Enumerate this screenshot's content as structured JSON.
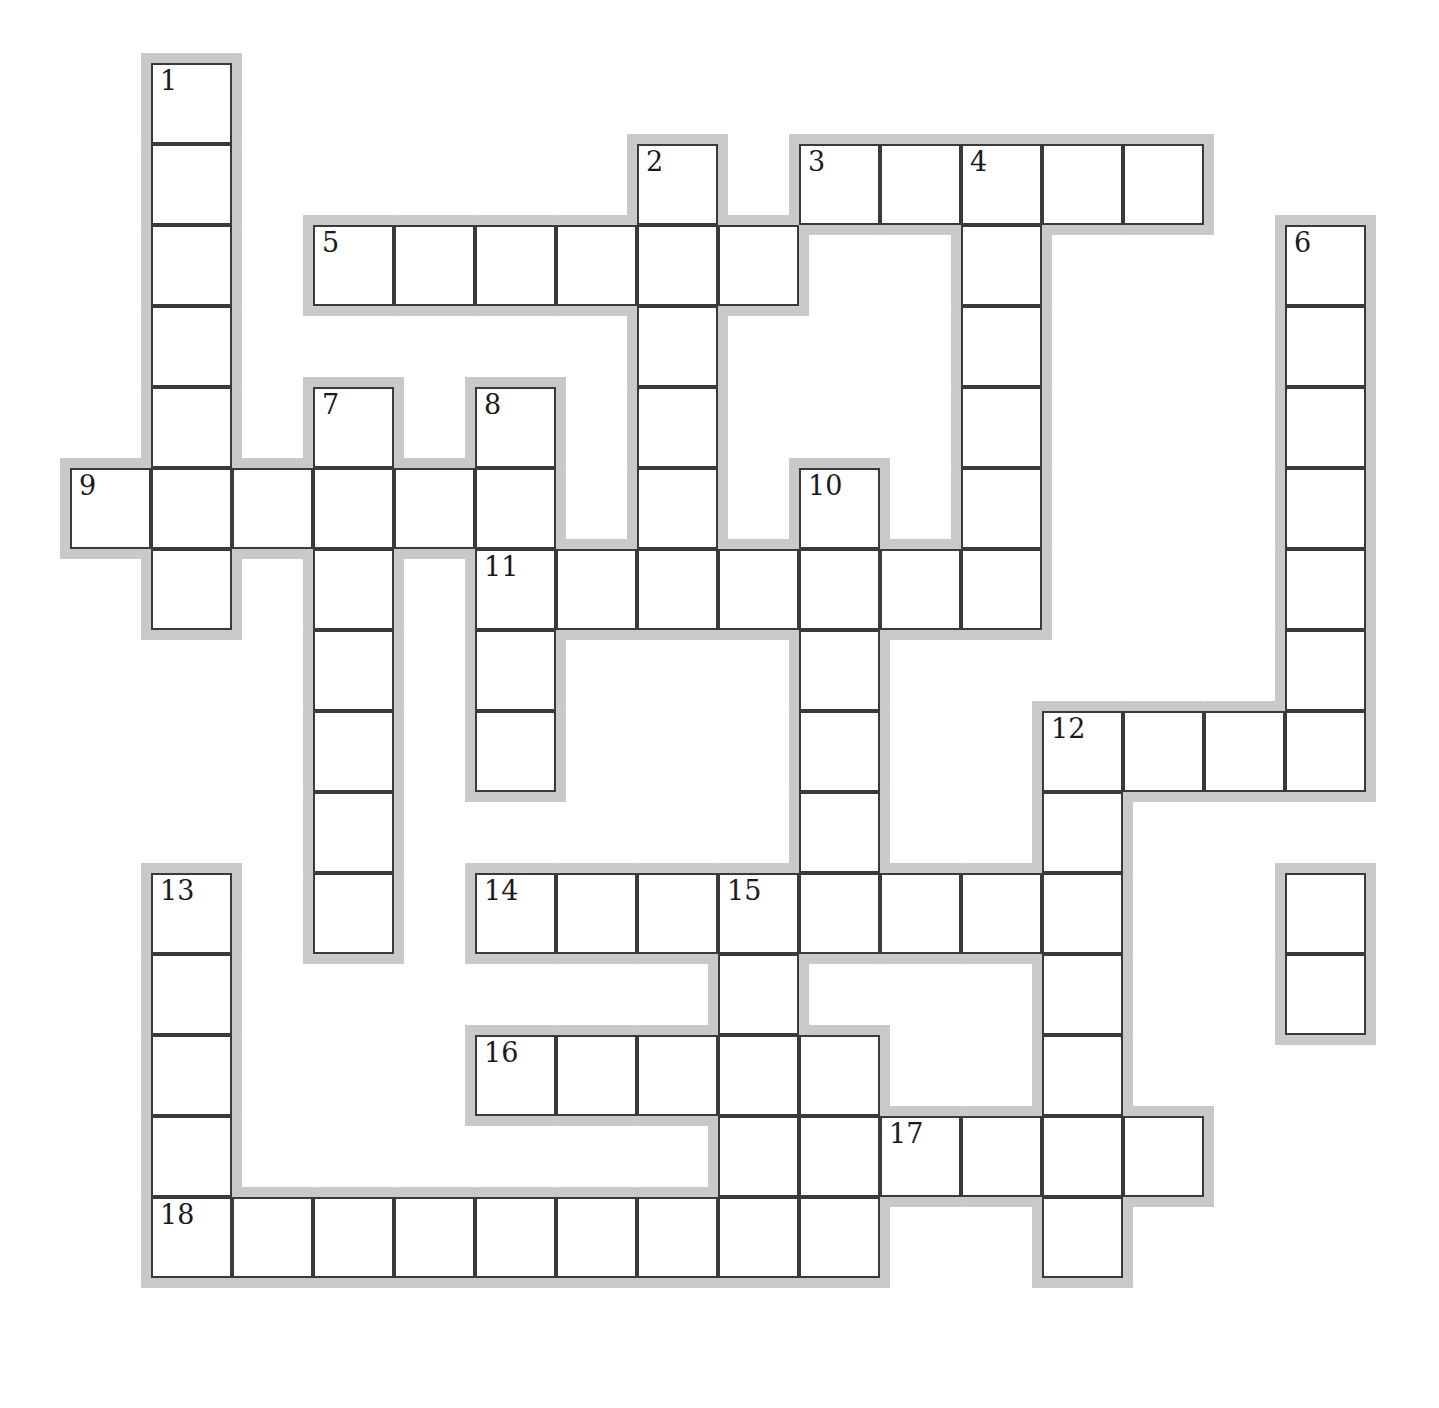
{
  "puzzle": {
    "kind": "crossword-grid",
    "title": "",
    "grid": {
      "cell_size": 81,
      "origin_x": 70,
      "origin_y": 63,
      "halo_width": 10,
      "columns": 16,
      "rows": 17,
      "cell_fill": "#ffffff",
      "cell_border_color": "#3a3a3a",
      "halo_color": "#c9c9c9",
      "number_color": "#1a1a1a",
      "background": "#ffffff"
    },
    "entries": [
      {
        "number": "1",
        "direction": "down",
        "col": 1,
        "row": 0,
        "length": 7
      },
      {
        "number": "2",
        "direction": "down",
        "col": 7,
        "row": 1,
        "length": 6
      },
      {
        "number": "3",
        "direction": "across",
        "col": 9,
        "row": 1,
        "length": 5
      },
      {
        "number": "4",
        "direction": "down",
        "col": 11,
        "row": 1,
        "length": 7
      },
      {
        "number": "5",
        "direction": "across",
        "col": 3,
        "row": 2,
        "length": 6
      },
      {
        "number": "6",
        "direction": "down",
        "col": 15,
        "row": 2,
        "length": 10
      },
      {
        "number": "7",
        "direction": "down",
        "col": 3,
        "row": 4,
        "length": 7
      },
      {
        "number": "8",
        "direction": "down",
        "col": 5,
        "row": 4,
        "length": 5
      },
      {
        "number": "9",
        "direction": "across",
        "col": 0,
        "row": 5,
        "length": 6
      },
      {
        "number": "10",
        "direction": "down",
        "col": 9,
        "row": 5,
        "length": 6
      },
      {
        "number": "11",
        "direction": "across",
        "col": 5,
        "row": 6,
        "length": 7
      },
      {
        "number": "12",
        "direction": "across",
        "col": 12,
        "row": 8,
        "length": 4
      },
      {
        "number": "13",
        "direction": "down",
        "col": 1,
        "row": 10,
        "length": 5
      },
      {
        "number": "14",
        "direction": "across",
        "col": 5,
        "row": 10,
        "length": 8
      },
      {
        "number": "15",
        "direction": "down",
        "col": 8,
        "row": 10,
        "length": 5
      },
      {
        "number": "16",
        "direction": "across",
        "col": 5,
        "row": 12,
        "length": 5
      },
      {
        "number": "17",
        "direction": "across",
        "col": 10,
        "row": 13,
        "length": 4
      },
      {
        "number": "18",
        "direction": "across",
        "col": 1,
        "row": 14,
        "length": 9
      }
    ],
    "cells": [
      {
        "col": 1,
        "row": 0,
        "number": "1",
        "letter": ""
      },
      {
        "col": 1,
        "row": 1,
        "number": "",
        "letter": ""
      },
      {
        "col": 1,
        "row": 2,
        "number": "",
        "letter": ""
      },
      {
        "col": 1,
        "row": 3,
        "number": "",
        "letter": ""
      },
      {
        "col": 1,
        "row": 4,
        "number": "",
        "letter": ""
      },
      {
        "col": 1,
        "row": 5,
        "number": "",
        "letter": ""
      },
      {
        "col": 1,
        "row": 6,
        "number": "",
        "letter": ""
      },
      {
        "col": 7,
        "row": 1,
        "number": "2",
        "letter": ""
      },
      {
        "col": 9,
        "row": 1,
        "number": "3",
        "letter": ""
      },
      {
        "col": 10,
        "row": 1,
        "number": "",
        "letter": ""
      },
      {
        "col": 11,
        "row": 1,
        "number": "4",
        "letter": ""
      },
      {
        "col": 12,
        "row": 1,
        "number": "",
        "letter": ""
      },
      {
        "col": 13,
        "row": 1,
        "number": "",
        "letter": ""
      },
      {
        "col": 3,
        "row": 2,
        "number": "5",
        "letter": ""
      },
      {
        "col": 4,
        "row": 2,
        "number": "",
        "letter": ""
      },
      {
        "col": 5,
        "row": 2,
        "number": "",
        "letter": ""
      },
      {
        "col": 6,
        "row": 2,
        "number": "",
        "letter": ""
      },
      {
        "col": 7,
        "row": 2,
        "number": "",
        "letter": ""
      },
      {
        "col": 8,
        "row": 2,
        "number": "",
        "letter": ""
      },
      {
        "col": 11,
        "row": 2,
        "number": "",
        "letter": ""
      },
      {
        "col": 15,
        "row": 2,
        "number": "6",
        "letter": ""
      },
      {
        "col": 7,
        "row": 3,
        "number": "",
        "letter": ""
      },
      {
        "col": 11,
        "row": 3,
        "number": "",
        "letter": ""
      },
      {
        "col": 15,
        "row": 3,
        "number": "",
        "letter": ""
      },
      {
        "col": 3,
        "row": 4,
        "number": "7",
        "letter": ""
      },
      {
        "col": 5,
        "row": 4,
        "number": "8",
        "letter": ""
      },
      {
        "col": 7,
        "row": 4,
        "number": "",
        "letter": ""
      },
      {
        "col": 11,
        "row": 4,
        "number": "",
        "letter": ""
      },
      {
        "col": 15,
        "row": 4,
        "number": "",
        "letter": ""
      },
      {
        "col": 0,
        "row": 5,
        "number": "9",
        "letter": ""
      },
      {
        "col": 1,
        "row": 5,
        "number": "",
        "letter": ""
      },
      {
        "col": 2,
        "row": 5,
        "number": "",
        "letter": ""
      },
      {
        "col": 3,
        "row": 5,
        "number": "",
        "letter": ""
      },
      {
        "col": 4,
        "row": 5,
        "number": "",
        "letter": ""
      },
      {
        "col": 5,
        "row": 5,
        "number": "",
        "letter": ""
      },
      {
        "col": 7,
        "row": 5,
        "number": "",
        "letter": ""
      },
      {
        "col": 9,
        "row": 5,
        "number": "10",
        "letter": ""
      },
      {
        "col": 11,
        "row": 5,
        "number": "",
        "letter": ""
      },
      {
        "col": 15,
        "row": 5,
        "number": "",
        "letter": ""
      },
      {
        "col": 1,
        "row": 6,
        "number": "",
        "letter": ""
      },
      {
        "col": 3,
        "row": 6,
        "number": "",
        "letter": ""
      },
      {
        "col": 5,
        "row": 6,
        "number": "11",
        "letter": ""
      },
      {
        "col": 6,
        "row": 6,
        "number": "",
        "letter": ""
      },
      {
        "col": 7,
        "row": 6,
        "number": "",
        "letter": ""
      },
      {
        "col": 8,
        "row": 6,
        "number": "",
        "letter": ""
      },
      {
        "col": 9,
        "row": 6,
        "number": "",
        "letter": ""
      },
      {
        "col": 10,
        "row": 6,
        "number": "",
        "letter": ""
      },
      {
        "col": 11,
        "row": 6,
        "number": "",
        "letter": ""
      },
      {
        "col": 15,
        "row": 6,
        "number": "",
        "letter": ""
      },
      {
        "col": 3,
        "row": 7,
        "number": "",
        "letter": ""
      },
      {
        "col": 5,
        "row": 7,
        "number": "",
        "letter": ""
      },
      {
        "col": 9,
        "row": 7,
        "number": "",
        "letter": ""
      },
      {
        "col": 15,
        "row": 7,
        "number": "",
        "letter": ""
      },
      {
        "col": 3,
        "row": 8,
        "number": "",
        "letter": ""
      },
      {
        "col": 5,
        "row": 8,
        "number": "",
        "letter": ""
      },
      {
        "col": 9,
        "row": 8,
        "number": "",
        "letter": ""
      },
      {
        "col": 12,
        "row": 8,
        "number": "12",
        "letter": ""
      },
      {
        "col": 13,
        "row": 8,
        "number": "",
        "letter": ""
      },
      {
        "col": 14,
        "row": 8,
        "number": "",
        "letter": ""
      },
      {
        "col": 15,
        "row": 8,
        "number": "",
        "letter": ""
      },
      {
        "col": 3,
        "row": 9,
        "number": "",
        "letter": ""
      },
      {
        "col": 9,
        "row": 9,
        "number": "",
        "letter": ""
      },
      {
        "col": 12,
        "row": 9,
        "number": "",
        "letter": ""
      },
      {
        "col": 1,
        "row": 10,
        "number": "13",
        "letter": ""
      },
      {
        "col": 3,
        "row": 10,
        "number": "",
        "letter": ""
      },
      {
        "col": 5,
        "row": 10,
        "number": "14",
        "letter": ""
      },
      {
        "col": 6,
        "row": 10,
        "number": "",
        "letter": ""
      },
      {
        "col": 7,
        "row": 10,
        "number": "",
        "letter": ""
      },
      {
        "col": 8,
        "row": 10,
        "number": "15",
        "letter": ""
      },
      {
        "col": 9,
        "row": 10,
        "number": "",
        "letter": ""
      },
      {
        "col": 10,
        "row": 10,
        "number": "",
        "letter": ""
      },
      {
        "col": 11,
        "row": 10,
        "number": "",
        "letter": ""
      },
      {
        "col": 12,
        "row": 10,
        "number": "",
        "letter": ""
      },
      {
        "col": 15,
        "row": 10,
        "number": "",
        "letter": ""
      },
      {
        "col": 1,
        "row": 11,
        "number": "",
        "letter": ""
      },
      {
        "col": 8,
        "row": 11,
        "number": "",
        "letter": ""
      },
      {
        "col": 12,
        "row": 11,
        "number": "",
        "letter": ""
      },
      {
        "col": 15,
        "row": 11,
        "number": "",
        "letter": ""
      },
      {
        "col": 1,
        "row": 12,
        "number": "",
        "letter": ""
      },
      {
        "col": 5,
        "row": 12,
        "number": "16",
        "letter": ""
      },
      {
        "col": 6,
        "row": 12,
        "number": "",
        "letter": ""
      },
      {
        "col": 7,
        "row": 12,
        "number": "",
        "letter": ""
      },
      {
        "col": 8,
        "row": 12,
        "number": "",
        "letter": ""
      },
      {
        "col": 9,
        "row": 12,
        "number": "",
        "letter": ""
      },
      {
        "col": 12,
        "row": 12,
        "number": "",
        "letter": ""
      },
      {
        "col": 1,
        "row": 13,
        "number": "",
        "letter": ""
      },
      {
        "col": 8,
        "row": 13,
        "number": "",
        "letter": ""
      },
      {
        "col": 9,
        "row": 13,
        "number": "",
        "letter": ""
      },
      {
        "col": 10,
        "row": 13,
        "number": "17",
        "letter": ""
      },
      {
        "col": 11,
        "row": 13,
        "number": "",
        "letter": ""
      },
      {
        "col": 12,
        "row": 13,
        "number": "",
        "letter": ""
      },
      {
        "col": 13,
        "row": 13,
        "number": "",
        "letter": ""
      },
      {
        "col": 1,
        "row": 14,
        "number": "18",
        "letter": ""
      },
      {
        "col": 2,
        "row": 14,
        "number": "",
        "letter": ""
      },
      {
        "col": 3,
        "row": 14,
        "number": "",
        "letter": ""
      },
      {
        "col": 4,
        "row": 14,
        "number": "",
        "letter": ""
      },
      {
        "col": 5,
        "row": 14,
        "number": "",
        "letter": ""
      },
      {
        "col": 6,
        "row": 14,
        "number": "",
        "letter": ""
      },
      {
        "col": 7,
        "row": 14,
        "number": "",
        "letter": ""
      },
      {
        "col": 8,
        "row": 14,
        "number": "",
        "letter": ""
      },
      {
        "col": 9,
        "row": 14,
        "number": "",
        "letter": ""
      },
      {
        "col": 12,
        "row": 14,
        "number": "",
        "letter": ""
      }
    ]
  }
}
